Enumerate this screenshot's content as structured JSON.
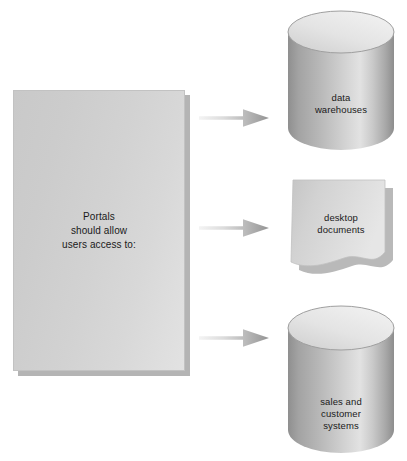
{
  "diagram": {
    "type": "flow-diagram",
    "background_color": "#ffffff",
    "source": {
      "name": "portals-panel",
      "shape": "rectangle-with-shadow",
      "fill_color": "#d2d2d2",
      "shadow_color": "#b4b4b4",
      "text_lines": [
        "Portals",
        "should allow",
        "users access to:"
      ]
    },
    "connectors": [
      {
        "name": "arrow-to-data-warehouses",
        "direction": "right",
        "gradient_from": "#f2f2f2",
        "gradient_to": "#9a9a9a"
      },
      {
        "name": "arrow-to-desktop-documents",
        "direction": "right",
        "gradient_from": "#f2f2f2",
        "gradient_to": "#9a9a9a"
      },
      {
        "name": "arrow-to-sales-systems",
        "direction": "right",
        "gradient_from": "#f2f2f2",
        "gradient_to": "#9a9a9a"
      }
    ],
    "targets": [
      {
        "name": "data-warehouses",
        "shape": "cylinder",
        "label_lines": [
          "data",
          "warehouses"
        ],
        "fill_light": "#e6e6e6",
        "fill_dark": "#9b9b9b"
      },
      {
        "name": "desktop-documents",
        "shape": "document",
        "label_lines": [
          "desktop",
          "documents"
        ],
        "fill_light": "#e4e4e4",
        "fill_dark": "#bdbdbd"
      },
      {
        "name": "sales-customer-systems",
        "shape": "cylinder",
        "label_lines": [
          "sales and",
          "customer",
          "systems"
        ],
        "fill_light": "#e6e6e6",
        "fill_dark": "#9b9b9b"
      }
    ]
  }
}
